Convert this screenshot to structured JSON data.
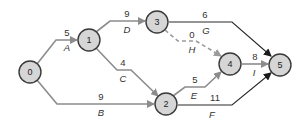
{
  "diagram": {
    "type": "activity-on-arrow network",
    "colors": {
      "node_fill": "#d6d6d6",
      "node_stroke": "#3a3a3a",
      "edge_gray": "#8c8c8c",
      "edge_dark": "#2a2a2a",
      "edge_dummy": "#9a9a9a"
    },
    "nodes": [
      {
        "id": "0",
        "label": "0"
      },
      {
        "id": "1",
        "label": "1"
      },
      {
        "id": "2",
        "label": "2"
      },
      {
        "id": "3",
        "label": "3"
      },
      {
        "id": "4",
        "label": "4"
      },
      {
        "id": "5",
        "label": "5"
      }
    ],
    "edges": [
      {
        "activity": "A",
        "duration": "5",
        "from": "0",
        "to": "1",
        "style": "gray"
      },
      {
        "activity": "B",
        "duration": "9",
        "from": "0",
        "to": "2",
        "style": "gray"
      },
      {
        "activity": "C",
        "duration": "4",
        "from": "1",
        "to": "2",
        "style": "gray"
      },
      {
        "activity": "D",
        "duration": "9",
        "from": "1",
        "to": "3",
        "style": "gray"
      },
      {
        "activity": "E",
        "duration": "5",
        "from": "2",
        "to": "4",
        "style": "gray"
      },
      {
        "activity": "F",
        "duration": "11",
        "from": "2",
        "to": "5",
        "style": "dark"
      },
      {
        "activity": "G",
        "duration": "6",
        "from": "3",
        "to": "5",
        "style": "dark"
      },
      {
        "activity": "H",
        "duration": "0",
        "from": "3",
        "to": "4",
        "style": "dashed"
      },
      {
        "activity": "I",
        "duration": "8",
        "from": "4",
        "to": "5",
        "style": "gray"
      }
    ]
  }
}
